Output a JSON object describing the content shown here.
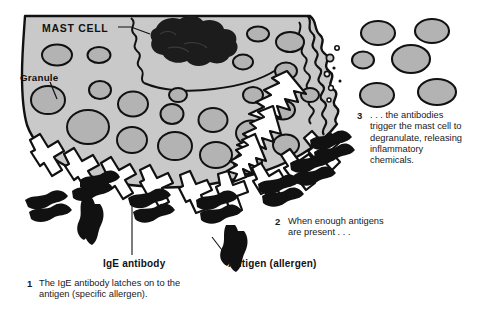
{
  "figure": {
    "background_color": "#ffffff",
    "cell_fill": "#c9c9c9",
    "granule_fill": "#b0b0b0",
    "outline_color": "#111111",
    "nucleus_color": "#1a1a1a",
    "antigen_color": "#111111"
  },
  "labels": {
    "mast_cell": "MAST CELL",
    "granule": "Granule",
    "ige_antibody": "IgE antibody",
    "antigen": "Antigen (allergen)"
  },
  "steps": [
    {
      "number": "1",
      "text": "The IgE antibody latches on to the antigen (specific allergen)."
    },
    {
      "number": "2",
      "text": "When enough antigens are present . . ."
    },
    {
      "number": "3",
      "text": ". . . the antibodies trigger the mast cell to degranulate, releasing inflammatory chemicals."
    }
  ],
  "icons": {
    "antibody": "y-shaped-antibody-icon",
    "antigen": "squiggle-antigen-icon",
    "release_arrow": "lightning-arrow-icon",
    "nucleus": "nucleus-blob-icon",
    "granule": "granule-ellipse-icon"
  },
  "diagram_elements": {
    "internal_granule_count": 22,
    "released_granule_count": 6,
    "membrane_antibody_count": 9,
    "free_antigen_count": 9,
    "release_arrow_count": 3
  }
}
